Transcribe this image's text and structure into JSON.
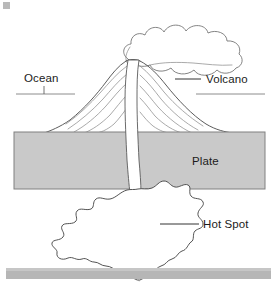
{
  "diagram": {
    "title": "Hot Spot Volcano Cross Section",
    "type": "cross-section-diagram",
    "canvas": {
      "width": 277,
      "height": 285,
      "background": "#ffffff"
    },
    "labels": {
      "ocean": "Ocean",
      "volcano": "Volcano",
      "plate": "Plate",
      "hot_spot": "Hot Spot"
    },
    "colors": {
      "plate_fill": "#c9c9c9",
      "plate_stroke": "#808080",
      "outline_stroke": "#4a4a4a",
      "flowline_stroke": "#8d8d8d",
      "label_text": "#1b1b1b",
      "sea_level_line": "#6f6f6f",
      "footer_bar": "#b6b6b6",
      "background": "#ffffff"
    },
    "features": [
      {
        "name": "ocean",
        "label": "Ocean",
        "description": "Sea level surface line across the figure at the volcano flanks",
        "label_position": {
          "x": 24,
          "y": 82
        },
        "leader": {
          "type": "vertical-tick",
          "x": 44,
          "y1": 86,
          "y2": 94
        }
      },
      {
        "name": "volcano",
        "label": "Volcano",
        "description": "Shield volcano cone with layered lava flow bands rising above the plate",
        "label_position": {
          "x": 206,
          "y": 82
        },
        "leader": {
          "type": "horizontal-line",
          "x1": 175,
          "x2": 201,
          "y": 79
        }
      },
      {
        "name": "plate",
        "label": "Plate",
        "description": "Gray horizontal lithospheric plate band",
        "label_position": {
          "x": 192,
          "y": 165
        },
        "rect": {
          "x": 14,
          "y": 132,
          "width": 251,
          "height": 57
        }
      },
      {
        "name": "hot-spot",
        "label": "Hot Spot",
        "description": "Jagged magma plume blob beneath the plate feeding the conduit",
        "label_position": {
          "x": 203,
          "y": 228
        },
        "leader": {
          "type": "horizontal-line",
          "x1": 160,
          "x2": 199,
          "y": 224
        }
      },
      {
        "name": "magma-conduit",
        "label": "",
        "description": "Narrow vertical white channel connecting hot spot to volcano vent"
      },
      {
        "name": "eruption-plume",
        "label": "",
        "description": "Billowing ash and smoke cloud drifting up and to the right from the summit vent"
      }
    ],
    "footer_bar": {
      "x": 6,
      "y": 268,
      "width": 265,
      "height": 11
    },
    "corner_mark": {
      "x": 3,
      "y": 2,
      "width": 7,
      "height": 7
    }
  }
}
